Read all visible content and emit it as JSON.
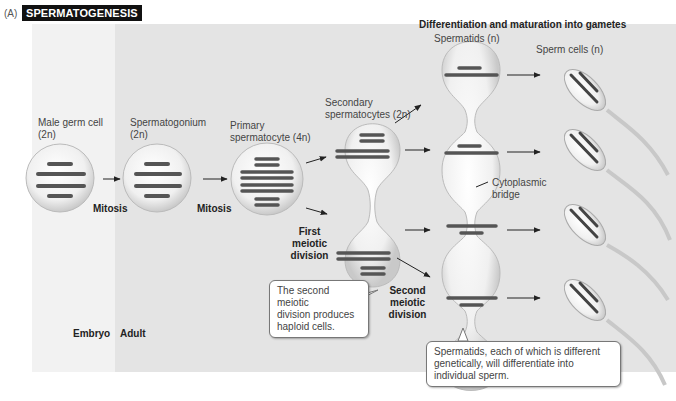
{
  "header": {
    "panel_label": "(A)",
    "title": "SPERMATOGENESIS"
  },
  "section_title": "Differentiation and maturation into gametes",
  "stages": {
    "male_germ_cell": {
      "line1": "Male germ cell",
      "line2": "(2n)"
    },
    "spermatogonium": {
      "line1": "Spermatogonium",
      "line2": "(2n)"
    },
    "primary_spermatocyte": {
      "line1": "Primary",
      "line2": "spermatocyte (4n)"
    },
    "secondary_spermatocytes": {
      "line1": "Secondary",
      "line2": "spermatocytes (2n)"
    },
    "spermatids": {
      "label": "Spermatids (n)"
    },
    "sperm_cells": {
      "label": "Sperm cells (n)"
    }
  },
  "processes": {
    "mitosis_1": "Mitosis",
    "mitosis_2": "Mitosis",
    "first_meiotic": [
      "First",
      "meiotic",
      "division"
    ],
    "second_meiotic": [
      "Second",
      "meiotic",
      "division"
    ],
    "cytoplasmic_bridge": [
      "Cytoplasmic",
      "bridge"
    ]
  },
  "regions": {
    "embryo": "Embryo",
    "adult": "Adult"
  },
  "callouts": {
    "second_division": [
      "The second meiotic",
      "division produces",
      "haploid cells."
    ],
    "spermatids": [
      "Spermatids, each of which is different",
      "genetically, will differentiate into",
      "individual sperm."
    ]
  },
  "colors": {
    "title_bg": "#111111",
    "embryo_bg": "#f2f2f2",
    "adult_bg": "#e4e4e4",
    "chromosome": "#555555",
    "cell_fill": "#f7f7f7"
  }
}
